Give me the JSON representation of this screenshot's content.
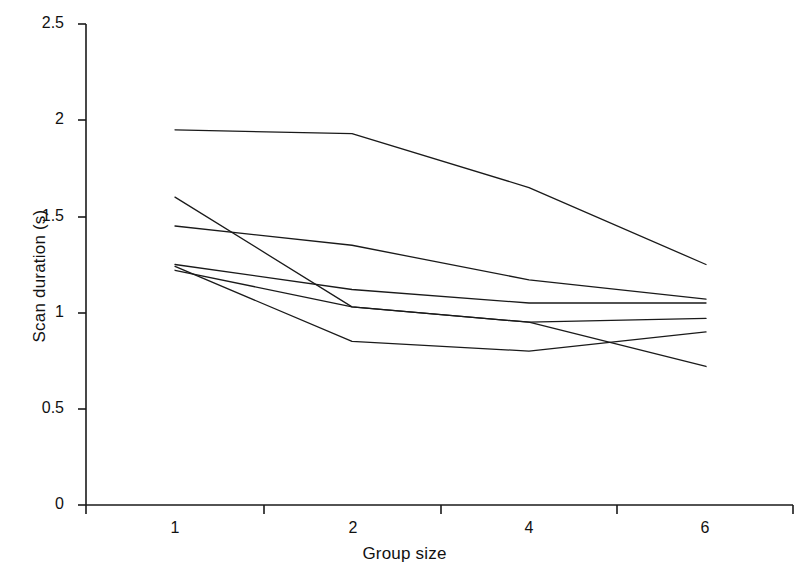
{
  "chart_data": {
    "type": "line",
    "title": "",
    "xlabel": "Group size",
    "ylabel": "Scan duration (s)",
    "categories": [
      "1",
      "2",
      "4",
      "6"
    ],
    "x": [
      1,
      2,
      4,
      6
    ],
    "xlim": [
      0,
      4
    ],
    "ylim": [
      0,
      2.5
    ],
    "yticks": [
      0,
      0.5,
      1,
      1.5,
      2,
      2.5
    ],
    "ytick_labels": [
      "0",
      "0.5",
      "1",
      "1.5",
      "2",
      "2.5"
    ],
    "xtick_labels": [
      "1",
      "2",
      "4",
      "6"
    ],
    "grid": false,
    "legend": null,
    "line_color": "#1a1a1a",
    "line_width": 1.3,
    "markers": "none",
    "series": [
      {
        "name": "series-1",
        "values": [
          1.95,
          1.93,
          1.65,
          1.25
        ]
      },
      {
        "name": "series-2",
        "values": [
          1.45,
          1.35,
          1.17,
          1.07
        ]
      },
      {
        "name": "series-3",
        "values": [
          1.25,
          1.12,
          1.05,
          1.05
        ]
      },
      {
        "name": "series-4",
        "values": [
          1.22,
          1.03,
          0.95,
          0.97
        ]
      },
      {
        "name": "series-5",
        "values": [
          1.24,
          0.85,
          0.8,
          0.9
        ]
      },
      {
        "name": "series-6",
        "values": [
          1.6,
          1.03,
          0.95,
          0.72
        ]
      }
    ]
  },
  "axes": {
    "y_axis_name": "y-axis",
    "x_axis_name": "x-axis"
  }
}
